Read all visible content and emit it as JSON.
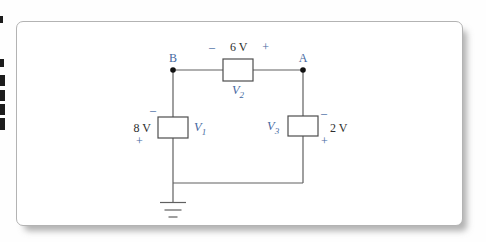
{
  "circuit": {
    "type": "dc-circuit-figure",
    "node_labels": {
      "b": "B",
      "a": "A"
    },
    "elements": {
      "v2": {
        "label_base": "V",
        "label_sub": "2",
        "value": "6 V",
        "polarity_minus": "–",
        "polarity_plus": "+"
      },
      "v1": {
        "label_base": "V",
        "label_sub": "1",
        "value": "8 V",
        "polarity_minus": "–",
        "polarity_plus": "+"
      },
      "v3": {
        "label_base": "V",
        "label_sub": "3",
        "value": "2 V",
        "polarity_minus": "–",
        "polarity_plus": "+"
      }
    },
    "colors": {
      "label_blue": "#4468a0",
      "wire_gray": "#606060",
      "value_dark": "#2e2e2e",
      "panel_border": "#b3b3b3"
    }
  }
}
